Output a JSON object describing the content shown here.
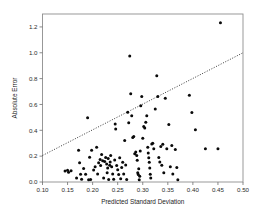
{
  "chart_data": {
    "type": "scatter",
    "title": "",
    "xlabel": "Predicted Standard Deviation",
    "ylabel": "Absolute Error",
    "xlim": [
      0.1,
      0.5
    ],
    "ylim": [
      0.0,
      1.3
    ],
    "grid": false,
    "legend": null,
    "xticks": [
      0.1,
      0.15,
      0.2,
      0.25,
      0.3,
      0.35,
      0.4,
      0.45,
      0.5
    ],
    "xticklabels": [
      "0.10",
      "0.15",
      "0.20",
      "0.25",
      "0.30",
      "0.35",
      "0.40",
      "0.45",
      "0.50"
    ],
    "yticks": [
      0.0,
      0.2,
      0.4,
      0.6,
      0.8,
      1.0,
      1.2
    ],
    "yticklabels": [
      "0.0",
      "0.2",
      "0.4",
      "0.6",
      "0.8",
      "1.0",
      "1.2"
    ],
    "marker": "filled-circle",
    "marker_color": "#0a0a0a",
    "marker_size": 3.0,
    "points": [
      [
        0.145,
        0.085
      ],
      [
        0.15,
        0.09
      ],
      [
        0.152,
        0.075
      ],
      [
        0.157,
        0.088
      ],
      [
        0.168,
        0.03
      ],
      [
        0.172,
        0.245
      ],
      [
        0.174,
        0.148
      ],
      [
        0.176,
        0.06
      ],
      [
        0.178,
        0.022
      ],
      [
        0.182,
        0.105
      ],
      [
        0.186,
        0.06
      ],
      [
        0.19,
        0.497
      ],
      [
        0.192,
        0.017
      ],
      [
        0.194,
        0.192
      ],
      [
        0.196,
        0.02
      ],
      [
        0.198,
        0.245
      ],
      [
        0.202,
        0.092
      ],
      [
        0.205,
        0.118
      ],
      [
        0.208,
        0.268
      ],
      [
        0.21,
        0.062
      ],
      [
        0.212,
        0.148
      ],
      [
        0.215,
        0.175
      ],
      [
        0.216,
        0.128
      ],
      [
        0.218,
        0.212
      ],
      [
        0.22,
        0.165
      ],
      [
        0.222,
        0.03
      ],
      [
        0.224,
        0.158
      ],
      [
        0.226,
        0.19
      ],
      [
        0.228,
        0.14
      ],
      [
        0.229,
        0.072
      ],
      [
        0.23,
        0.108
      ],
      [
        0.231,
        0.182
      ],
      [
        0.232,
        0.02
      ],
      [
        0.234,
        0.13
      ],
      [
        0.235,
        0.155
      ],
      [
        0.236,
        0.205
      ],
      [
        0.238,
        0.118
      ],
      [
        0.24,
        0.062
      ],
      [
        0.242,
        0.022
      ],
      [
        0.244,
        0.17
      ],
      [
        0.245,
        0.448
      ],
      [
        0.246,
        0.41
      ],
      [
        0.248,
        0.128
      ],
      [
        0.25,
        0.095
      ],
      [
        0.252,
        0.058
      ],
      [
        0.254,
        0.188
      ],
      [
        0.256,
        0.025
      ],
      [
        0.258,
        0.112
      ],
      [
        0.26,
        0.152
      ],
      [
        0.262,
        0.062
      ],
      [
        0.264,
        0.322
      ],
      [
        0.266,
        0.132
      ],
      [
        0.268,
        0.02
      ],
      [
        0.27,
        0.54
      ],
      [
        0.272,
        0.458
      ],
      [
        0.274,
        0.975
      ],
      [
        0.276,
        0.683
      ],
      [
        0.278,
        0.512
      ],
      [
        0.28,
        0.345
      ],
      [
        0.282,
        0.352
      ],
      [
        0.284,
        0.218
      ],
      [
        0.286,
        0.232
      ],
      [
        0.288,
        0.205
      ],
      [
        0.289,
        0.168
      ],
      [
        0.29,
        0.072
      ],
      [
        0.291,
        0.058
      ],
      [
        0.292,
        0.102
      ],
      [
        0.293,
        0.018
      ],
      [
        0.294,
        0.045
      ],
      [
        0.295,
        0.24
      ],
      [
        0.296,
        0.59
      ],
      [
        0.298,
        0.662
      ],
      [
        0.3,
        0.338
      ],
      [
        0.302,
        0.43
      ],
      [
        0.304,
        0.418
      ],
      [
        0.306,
        0.462
      ],
      [
        0.308,
        0.512
      ],
      [
        0.31,
        0.268
      ],
      [
        0.311,
        0.225
      ],
      [
        0.312,
        0.188
      ],
      [
        0.313,
        0.152
      ],
      [
        0.314,
        0.108
      ],
      [
        0.315,
        0.06
      ],
      [
        0.316,
        0.03
      ],
      [
        0.318,
        0.295
      ],
      [
        0.32,
        0.3
      ],
      [
        0.322,
        0.258
      ],
      [
        0.325,
        0.565
      ],
      [
        0.328,
        0.822
      ],
      [
        0.33,
        0.662
      ],
      [
        0.332,
        0.19
      ],
      [
        0.334,
        0.155
      ],
      [
        0.336,
        0.275
      ],
      [
        0.338,
        0.13
      ],
      [
        0.34,
        0.292
      ],
      [
        0.342,
        0.072
      ],
      [
        0.345,
        0.648
      ],
      [
        0.348,
        0.258
      ],
      [
        0.352,
        0.445
      ],
      [
        0.355,
        0.118
      ],
      [
        0.358,
        0.282
      ],
      [
        0.36,
        0.062
      ],
      [
        0.365,
        0.252
      ],
      [
        0.368,
        0.112
      ],
      [
        0.37,
        0.018
      ],
      [
        0.393,
        0.672
      ],
      [
        0.398,
        0.538
      ],
      [
        0.405,
        0.405
      ],
      [
        0.425,
        0.258
      ],
      [
        0.45,
        0.258
      ],
      [
        0.455,
        1.232
      ]
    ],
    "trend": {
      "style": "dotted",
      "x0": 0.1,
      "y0": 0.205,
      "x1": 0.5,
      "y1": 1.0
    }
  }
}
